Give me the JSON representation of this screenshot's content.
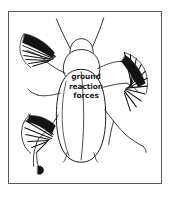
{
  "figure": {
    "caption": {
      "lines": [
        "ground",
        "reaction",
        "forces"
      ],
      "line1": "ground",
      "line2": "reaction",
      "line3": "forces"
    },
    "colors": {
      "background": "#ffffff",
      "frame_border": "#5a5a5a",
      "outline": "#1a1a1a",
      "force_vectors": "#111111",
      "caption_text": "#1d1d1d"
    },
    "frame": {
      "x": 8,
      "y": 11,
      "width": 154,
      "height": 173
    },
    "force_vector_fans": [
      {
        "name": "front-left-leg-force-fan",
        "position": "upper-left"
      },
      {
        "name": "middle-right-leg-force-fan",
        "position": "middle-right"
      },
      {
        "name": "hind-left-leg-force-fan",
        "position": "lower-left"
      }
    ]
  }
}
